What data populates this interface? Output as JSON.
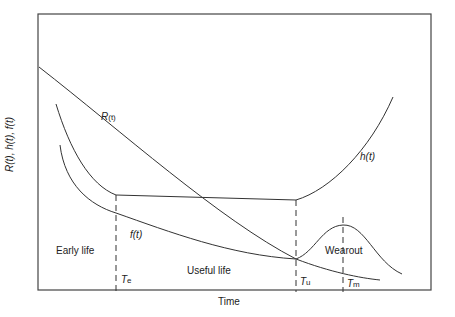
{
  "diagram": {
    "axes": {
      "x_label": "Time",
      "y_label": "R(t), h(t), f(t)"
    },
    "curves": {
      "reliability": {
        "label_main": "R",
        "label_sub": "(t)"
      },
      "hazard": {
        "label": "h(t)"
      },
      "density": {
        "label": "f(t)"
      }
    },
    "regions": [
      {
        "id": "early",
        "label": "Early life"
      },
      {
        "id": "useful",
        "label": "Useful life"
      },
      {
        "id": "wearout",
        "label": "Wearout"
      }
    ],
    "markers": [
      {
        "id": "te",
        "main": "T",
        "sub": "e"
      },
      {
        "id": "tu",
        "main": "T",
        "sub": "u"
      },
      {
        "id": "tm",
        "main": "T",
        "sub": "m"
      }
    ],
    "colors": {
      "line": "#333333",
      "frame": "#444444",
      "text": "#222222"
    }
  }
}
